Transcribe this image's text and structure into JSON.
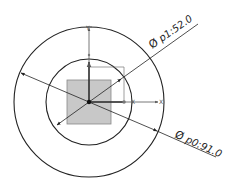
{
  "drawing": {
    "center": {
      "x": 89,
      "y": 102
    },
    "outer_circle": {
      "radius": 75,
      "label": "Ø p0:91.0"
    },
    "inner_circle": {
      "radius": 43,
      "label": "Ø p1:52.0"
    },
    "square": {
      "x": 67,
      "y": 80,
      "size": 44,
      "fill": "#c8c8c8"
    },
    "axes": {
      "x_label": "X",
      "y_label": "Y",
      "x_small_label": "X"
    },
    "colors": {
      "line": "#222222",
      "axis": "#444444",
      "square_fill": "#c8c8c8",
      "square_stroke": "#888888"
    }
  },
  "dimensions": {
    "p1_symbol": "Ø",
    "p1_text": "p1:52.0",
    "p0_symbol": "Ø",
    "p0_text": "p0:91.0"
  }
}
